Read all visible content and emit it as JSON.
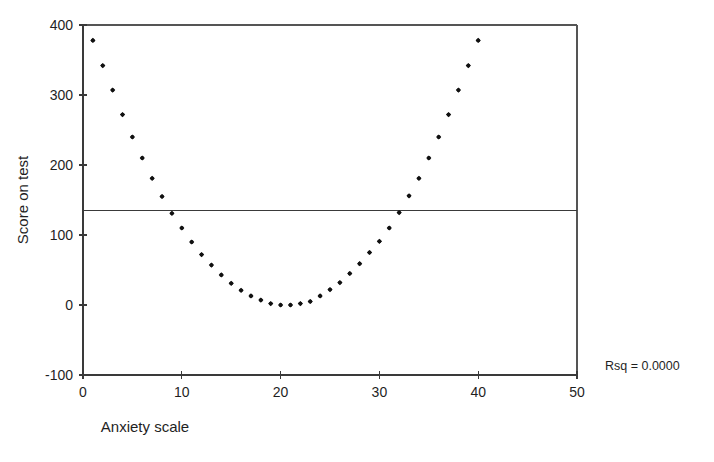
{
  "chart_data": {
    "type": "scatter",
    "title": "",
    "subtitle": "",
    "xlabel": "Anxiety scale",
    "ylabel": "Score on test",
    "xlim": [
      0,
      50
    ],
    "ylim": [
      -100,
      400
    ],
    "xticks": [
      0,
      10,
      20,
      30,
      40,
      50
    ],
    "yticks": [
      -100,
      0,
      100,
      200,
      300,
      400
    ],
    "xtick_labels": [
      "0",
      "10",
      "20",
      "30",
      "40",
      "50"
    ],
    "ytick_labels": [
      "-100",
      "0",
      "100",
      "200",
      "300",
      "400"
    ],
    "grid": false,
    "legend": null,
    "annotations": [
      {
        "name": "rsq-annotation",
        "text": "Rsq = 0.0000",
        "x": 52.5,
        "y": -95
      }
    ],
    "series": [
      {
        "name": "Score on test",
        "marker": "filled-diamond",
        "color": "#111111",
        "x": [
          1,
          2,
          3,
          4,
          5,
          6,
          7,
          8,
          9,
          10,
          11,
          12,
          13,
          14,
          15,
          16,
          17,
          18,
          19,
          20,
          21,
          22,
          23,
          24,
          25,
          26,
          27,
          28,
          29,
          30,
          31,
          32,
          33,
          34,
          35,
          36,
          37,
          38,
          39,
          40
        ],
        "y": [
          378,
          342,
          307,
          272,
          240,
          210,
          181,
          155,
          131,
          110,
          90,
          72,
          57,
          43,
          31,
          21,
          13,
          7,
          2,
          0,
          0,
          2,
          5,
          13,
          22,
          32,
          45,
          59,
          75,
          91,
          110,
          132,
          156,
          181,
          210,
          240,
          272,
          307,
          342,
          378
        ]
      }
    ],
    "fit_line": {
      "name": "regression-line",
      "type": "horizontal",
      "y": 135,
      "x_start": 0,
      "x_end": 50,
      "color": "#3a3a3a",
      "rsq": "0.0000"
    },
    "frame": {
      "top_border": true,
      "right_border": true,
      "left_axis": true,
      "bottom_axis": true
    }
  }
}
